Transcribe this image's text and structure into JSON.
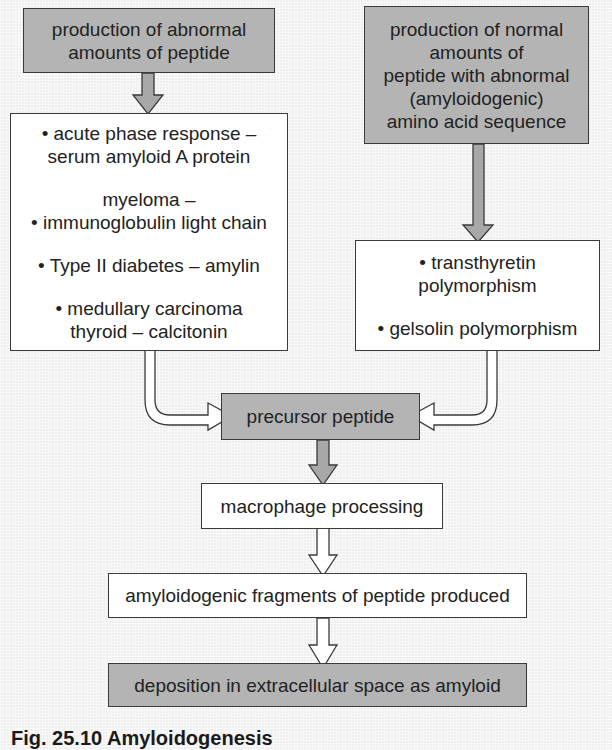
{
  "diagram": {
    "boxes": {
      "abnormal_amounts": {
        "lines": [
          "production of abnormal",
          "amounts of peptide"
        ],
        "fill": "#b4b4b4"
      },
      "normal_amounts": {
        "lines": [
          "production of normal",
          "amounts of",
          "peptide with abnormal",
          "(amyloidogenic)",
          "amino acid sequence"
        ],
        "fill": "#b4b4b4"
      },
      "causes_left": {
        "items": [
          [
            "• acute phase response –",
            "serum amyloid A protein"
          ],
          [
            "myeloma –",
            "• immunoglobulin light chain"
          ],
          [
            "• Type II diabetes – amylin"
          ],
          [
            "• medullary carcinoma",
            "thyroid – calcitonin"
          ]
        ],
        "fill": "#ffffff"
      },
      "causes_right": {
        "items": [
          [
            "• transthyretin",
            "polymorphism"
          ],
          [
            "• gelsolin polymorphism"
          ]
        ],
        "fill": "#ffffff"
      },
      "precursor": {
        "label": "precursor peptide",
        "fill": "#b4b4b4"
      },
      "macrophage": {
        "label": "macrophage processing",
        "fill": "#ffffff"
      },
      "fragments": {
        "label": "amyloidogenic fragments of peptide produced",
        "fill": "#ffffff"
      },
      "deposition": {
        "label": "deposition in extracellular space as amyloid",
        "fill": "#b4b4b4"
      }
    },
    "arrows": [
      {
        "from": "abnormal_amounts",
        "to": "causes_left",
        "style": "gray"
      },
      {
        "from": "normal_amounts",
        "to": "causes_right",
        "style": "gray"
      },
      {
        "from": "causes_left",
        "to": "precursor",
        "style": "white-outline"
      },
      {
        "from": "causes_right",
        "to": "precursor",
        "style": "white-outline"
      },
      {
        "from": "precursor",
        "to": "macrophage",
        "style": "gray"
      },
      {
        "from": "macrophage",
        "to": "fragments",
        "style": "white-outline"
      },
      {
        "from": "fragments",
        "to": "deposition",
        "style": "white-outline"
      }
    ],
    "colors": {
      "background": "#efefef",
      "gray_box": "#b4b4b4",
      "border": "#3a3a3a",
      "text": "#222222"
    }
  },
  "caption": "Fig. 25.10 Amyloidogenesis"
}
